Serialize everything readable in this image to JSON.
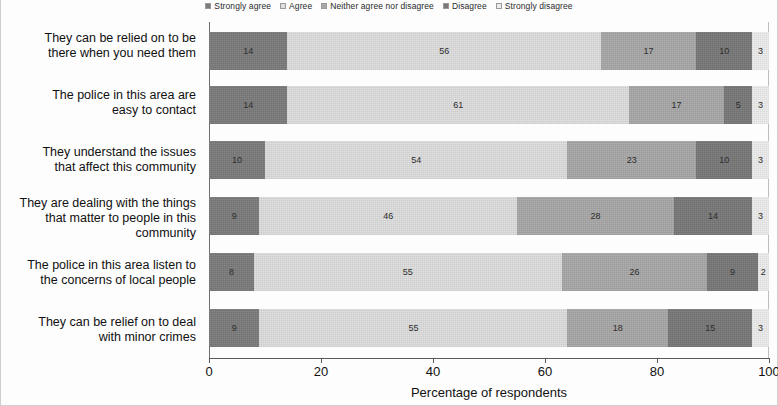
{
  "legend": {
    "items": [
      {
        "label": "Strongly agree",
        "color": "#7b7b7b"
      },
      {
        "label": "Agree",
        "color": "#dedede"
      },
      {
        "label": "Neither agree nor disagree",
        "color": "#a8a8a8"
      },
      {
        "label": "Disagree",
        "color": "#787878"
      },
      {
        "label": "Strongly disagree",
        "color": "#ededed"
      }
    ]
  },
  "axis": {
    "x_title": "Percentage of respondents",
    "x_ticks": [
      "0",
      "20",
      "40",
      "60",
      "80",
      "100"
    ]
  },
  "chart_data": {
    "type": "bar",
    "orientation": "horizontal",
    "stacked": true,
    "title": "",
    "xlabel": "Percentage of respondents",
    "ylabel": "",
    "xlim": [
      0,
      100
    ],
    "xticks": [
      0,
      20,
      40,
      60,
      80,
      100
    ],
    "grid": false,
    "legend_position": "top",
    "categories": [
      "They can be relied on to be there when you need them",
      "The police in this area are easy to contact",
      "They understand the issues that affect this community",
      "They are dealing with the things that matter to people in this community",
      "The police in this area listen to the concerns of local people",
      "They can be relief on to deal with minor crimes"
    ],
    "category_lines": [
      [
        "They can be relied on to be",
        "there when you need them"
      ],
      [
        "The police in this area are",
        "easy to contact"
      ],
      [
        "They understand the issues",
        "that affect this community"
      ],
      [
        "They are dealing with the things",
        "that matter to people in this",
        "community"
      ],
      [
        "The police in this area listen to",
        "the concerns of local people"
      ],
      [
        "They can be relief on to deal",
        "with minor crimes"
      ]
    ],
    "series": [
      {
        "name": "Strongly agree",
        "color": "#7b7b7b",
        "values": [
          14,
          14,
          10,
          9,
          8,
          9
        ]
      },
      {
        "name": "Agree",
        "color": "#dedede",
        "values": [
          56,
          61,
          54,
          46,
          55,
          55
        ]
      },
      {
        "name": "Neither agree nor disagree",
        "color": "#a8a8a8",
        "values": [
          17,
          17,
          23,
          28,
          26,
          18
        ]
      },
      {
        "name": "Disagree",
        "color": "#787878",
        "values": [
          10,
          5,
          10,
          14,
          9,
          15
        ]
      },
      {
        "name": "Strongly disagree",
        "color": "#ededed",
        "values": [
          3,
          3,
          3,
          3,
          2,
          3
        ]
      }
    ]
  }
}
